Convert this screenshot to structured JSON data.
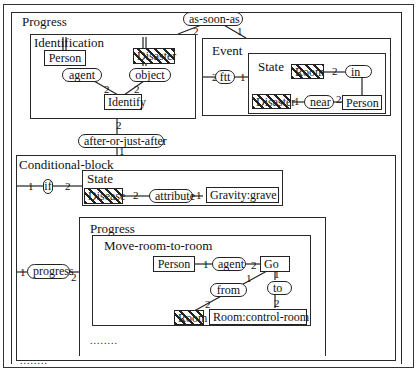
{
  "outer": {
    "progress_title": "Progress",
    "top_relation": "as-soon-as",
    "top_rel_arg_left": "2",
    "top_rel_arg_right": "1"
  },
  "identification": {
    "title": "Identification",
    "concept_person": "Person",
    "concept_disaster": "Disaster",
    "rel_agent": "agent",
    "rel_object": "object",
    "concept_identify": "Identify",
    "arg_agent": "2",
    "arg_object": "2"
  },
  "event": {
    "title": "Event",
    "rel_ftt": "ftt",
    "arg_left": "2",
    "arg_right": "1",
    "state": {
      "title": "State",
      "concept_room": "Room",
      "rel_in": "in",
      "arg_in": "2",
      "concept_disaster": "Disaster",
      "rel_near": "near",
      "arg_near_left": "1",
      "arg_near_right": "2",
      "concept_person": "Person"
    }
  },
  "middle": {
    "relation": "after-or-just-after",
    "arg_top": "2",
    "arg_bottom": "1"
  },
  "conditional": {
    "title": "Conditional-block",
    "rel_if": "if",
    "arg_if_left": "1",
    "arg_if_right": "2",
    "state": {
      "title": "State",
      "concept_disease": "Disease",
      "arg_attr_left": "2",
      "rel_attribute": "attribute",
      "arg_attr_right": "1",
      "concept_gravity": "Gravity:grave"
    },
    "rel_progress": "progress",
    "arg_progress_left": "1",
    "arg_progress_right": "2",
    "progress": {
      "title": "Progress",
      "move": {
        "title": "Move-room-to-room",
        "concept_person": "Person",
        "arg_agent_left": "1",
        "rel_agent": "agent",
        "arg_agent_right": "2",
        "concept_go": "Go",
        "rel_from": "from",
        "arg_from_top": "1",
        "arg_from_bottom": "2",
        "rel_to": "to",
        "arg_to_top": "1",
        "arg_to_bottom": "2",
        "concept_room": "Room",
        "concept_control_room": "Room:control-room"
      },
      "ellipsis": "........"
    },
    "ellipsis": "........"
  }
}
